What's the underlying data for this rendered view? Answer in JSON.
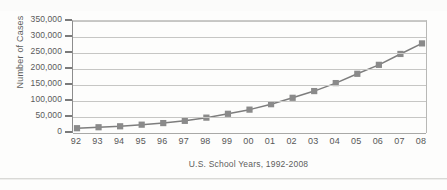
{
  "chart_data": {
    "type": "line",
    "title": "",
    "xlabel": "U.S. School Years, 1992-2008",
    "ylabel": "Number of Cases",
    "categories": [
      "92",
      "93",
      "94",
      "95",
      "96",
      "97",
      "98",
      "99",
      "00",
      "01",
      "02",
      "03",
      "04",
      "05",
      "06",
      "07",
      "08"
    ],
    "values": [
      15000,
      18000,
      21000,
      26000,
      31000,
      38000,
      48000,
      60000,
      73000,
      90000,
      110000,
      131000,
      156000,
      185000,
      213000,
      247000,
      280000
    ],
    "ylim": [
      0,
      350000
    ],
    "yticks": [
      0,
      50000,
      100000,
      150000,
      200000,
      250000,
      300000,
      350000
    ],
    "ytick_labels": [
      "0",
      "50,000",
      "100,000",
      "150,000",
      "200,000",
      "250,000",
      "300,000",
      "350,000"
    ],
    "grid": true,
    "legend": false,
    "legend_position": "none",
    "series_color": "#8a8a8a",
    "marker": "square",
    "line_color": "#7d7d7d",
    "grid_color": "#c6c6c4",
    "axis_color": "#8d8d8d",
    "text_color": "#575757"
  }
}
